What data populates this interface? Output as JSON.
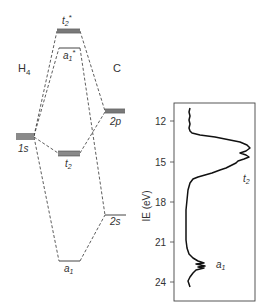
{
  "diagram": {
    "type": "molecular-orbital-diagram",
    "left_fragment": "H",
    "left_fragment_subscript": "4",
    "right_fragment": "C",
    "levels": {
      "h4_1s": {
        "label": "1s"
      },
      "c_2p": {
        "label": "2p"
      },
      "c_2s": {
        "label": "2s"
      },
      "t2_star": {
        "label": "t",
        "sub": "2",
        "sup": "*"
      },
      "a1_star": {
        "label": "a",
        "sub": "1",
        "sup": "*"
      },
      "t2": {
        "label": "t",
        "sub": "2"
      },
      "a1": {
        "label": "a",
        "sub": "1"
      }
    },
    "colors": {
      "level_fill": "#8a8a8a",
      "line": "#333333"
    }
  },
  "spectrum": {
    "ylabel": "IE (eV)",
    "ticks": [
      "12",
      "15",
      "18",
      "21",
      "24"
    ],
    "peak_labels": {
      "t2": {
        "label": "t",
        "sub": "2"
      },
      "a1": {
        "label": "a",
        "sub": "1"
      }
    }
  }
}
